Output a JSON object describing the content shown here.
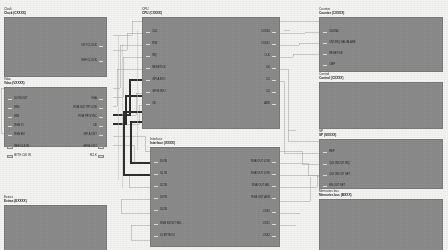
{
  "diagram": {
    "colors": {
      "background": "#f4f4f3",
      "block_fill": "#8b8b8b",
      "block_stroke": "#7b7b7b",
      "pin_pad_fill": "#d9d9d6",
      "wire_light": "#a9a9a9",
      "wire_dark": "#2f2f2f",
      "label_text": "#1a1a1a"
    }
  },
  "blocks": [
    {
      "id": "clock",
      "title": "Clock",
      "subtitle": "Clock (CXXXX)",
      "x": 4,
      "y": 8,
      "w": 103,
      "h": 60,
      "left_pins": [],
      "right_pins": [
        {
          "label": "OUT CLOCK",
          "y": 27
        },
        {
          "label": "REF CLOCK",
          "y": 42
        }
      ]
    },
    {
      "id": "video",
      "title": "Vdac",
      "subtitle": "Vdac (VXXXX)",
      "x": 4,
      "y": 78,
      "w": 103,
      "h": 60,
      "left_pins": [
        {
          "label": "D0 IN/OUT",
          "y": 10
        },
        {
          "label": "EN0",
          "y": 19
        },
        {
          "label": "EN1",
          "y": 28
        },
        {
          "label": "RGB IO",
          "y": 37
        },
        {
          "label": "RGB EN",
          "y": 46
        },
        {
          "label": "REF CLK IN",
          "y": 58
        },
        {
          "label": "BYTE CLK IN",
          "y": 67
        }
      ],
      "right_pins": [
        {
          "label": "VGA",
          "y": 10
        },
        {
          "label": "RGB OUT PP LOW",
          "y": 19
        },
        {
          "label": "RGB PP SYNC",
          "y": 28
        },
        {
          "label": "CE",
          "y": 37
        },
        {
          "label": "GPI A OUT",
          "y": 46
        },
        {
          "label": "GPI B OUT",
          "y": 58
        },
        {
          "label": "RCLK",
          "y": 67
        }
      ]
    },
    {
      "id": "extras",
      "title": "Extras",
      "subtitle": "Extras (EXXXX)",
      "x": 4,
      "y": 196,
      "w": 103,
      "h": 48,
      "left_pins": [],
      "right_pins": []
    },
    {
      "id": "cpu",
      "title": "CPU",
      "subtitle": "CPU (CXXXX)",
      "x": 142,
      "y": 8,
      "w": 138,
      "h": 112,
      "left_pins": [
        {
          "label": "CLK",
          "y": 13
        },
        {
          "label": "R/W",
          "y": 25
        },
        {
          "label": "IRQ",
          "y": 37
        },
        {
          "label": "RESET/CS",
          "y": 49
        },
        {
          "label": "GPI A IN/O",
          "y": 61
        },
        {
          "label": "GPI B IN/O",
          "y": 73
        },
        {
          "label": "CE",
          "y": 85
        }
      ],
      "right_pins": [
        {
          "label": "CXXX0",
          "y": 13
        },
        {
          "label": "CXXX1",
          "y": 25
        },
        {
          "label": "CLK",
          "y": 37
        },
        {
          "label": "D0",
          "y": 49
        },
        {
          "label": "D1",
          "y": 61
        },
        {
          "label": "D2",
          "y": 73
        },
        {
          "label": "ADR",
          "y": 85
        }
      ]
    },
    {
      "id": "interface",
      "title": "Interface",
      "subtitle": "Interface (IXXXX)",
      "x": 150,
      "y": 138,
      "w": 130,
      "h": 100,
      "left_pins": [
        {
          "label": "D0 IN",
          "y": 13
        },
        {
          "label": "D1 IN",
          "y": 25
        },
        {
          "label": "D2 IN",
          "y": 37
        },
        {
          "label": "D3 IN",
          "y": 49
        },
        {
          "label": "D4 IN",
          "y": 61
        },
        {
          "label": "RGB IN/OUT SEL",
          "y": 75
        },
        {
          "label": "IO BYTE I/O",
          "y": 87
        }
      ],
      "right_pins": [
        {
          "label": "RGB OUT LOW",
          "y": 13
        },
        {
          "label": "RGB OUT LOW",
          "y": 25
        },
        {
          "label": "RGB OUT SEL",
          "y": 37
        },
        {
          "label": "RGB OUT ADR",
          "y": 49
        },
        {
          "label": "CXX0",
          "y": 63
        },
        {
          "label": "CXX1",
          "y": 75
        },
        {
          "label": "CXX2",
          "y": 87
        }
      ]
    },
    {
      "id": "counter",
      "title": "Counter",
      "subtitle": "Counter (CXXXX)",
      "x": 319,
      "y": 8,
      "w": 124,
      "h": 55,
      "left_pins": [
        {
          "label": "CLKIN0",
          "y": 13
        },
        {
          "label": "CNT/IRQ SEL/BLANK",
          "y": 24
        },
        {
          "label": "RESET/CE",
          "y": 35
        },
        {
          "label": "CMP",
          "y": 46
        }
      ],
      "right_pins": []
    },
    {
      "id": "control",
      "title": "Control",
      "subtitle": "Control (CXXXX)",
      "x": 319,
      "y": 73,
      "w": 124,
      "h": 47,
      "left_pins": [],
      "right_pins": []
    },
    {
      "id": "sp",
      "title": "SP",
      "subtitle": "SP (SXXXX)",
      "x": 319,
      "y": 130,
      "w": 124,
      "h": 50,
      "left_pins": [
        {
          "label": "REF",
          "y": 11
        },
        {
          "label": "CLK IN/OUT IRQ",
          "y": 23
        },
        {
          "label": "CLK IN/OUT SET",
          "y": 34
        },
        {
          "label": "EN OUT SET",
          "y": 45
        }
      ],
      "right_pins": []
    },
    {
      "id": "memories",
      "title": "Memories bus",
      "subtitle": "Memories bus (MXXX)",
      "x": 319,
      "y": 190,
      "w": 124,
      "h": 52,
      "left_pins": [],
      "right_pins": []
    }
  ],
  "wires": {
    "light_color": "#a9a9a9",
    "dark_color": "#2f2f2f",
    "count_visible": 24
  }
}
